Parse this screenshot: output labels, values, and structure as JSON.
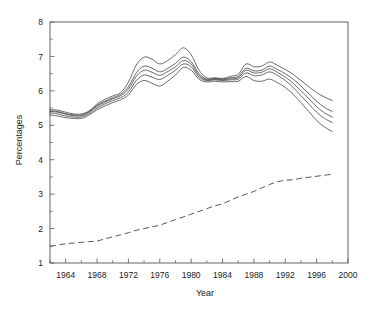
{
  "chart_data": {
    "type": "line",
    "title": "",
    "subtitle": "",
    "xlabel": "Year",
    "ylabel": "Percentages",
    "xlim": [
      1962,
      2000
    ],
    "ylim": [
      1,
      8
    ],
    "xticks": [
      1964,
      1968,
      1972,
      1976,
      1980,
      1984,
      1988,
      1992,
      1996,
      2000
    ],
    "xtick_labels": [
      "1964",
      "1968",
      "1972",
      "1976",
      "1980",
      "1984",
      "1988",
      "1992",
      "1996",
      "2000"
    ],
    "x_minor_step": 2,
    "yticks": [
      1,
      2,
      3,
      4,
      5,
      6,
      7,
      8
    ],
    "ytick_labels": [
      "1",
      "2",
      "3",
      "4",
      "5",
      "6",
      "7",
      "8"
    ],
    "y_minor_step": 0.5,
    "grid": false,
    "legend_position": "none",
    "frame": "box",
    "x": [
      1962,
      1963,
      1964,
      1965,
      1966,
      1967,
      1968,
      1969,
      1970,
      1971,
      1972,
      1973,
      1974,
      1975,
      1976,
      1977,
      1978,
      1979,
      1980,
      1981,
      1982,
      1983,
      1984,
      1985,
      1986,
      1987,
      1988,
      1989,
      1990,
      1991,
      1992,
      1993,
      1994,
      1995,
      1996,
      1997,
      1998
    ],
    "series": [
      {
        "name": "upper-band",
        "style": "solid",
        "values": [
          5.45,
          5.44,
          5.38,
          5.33,
          5.33,
          5.42,
          5.62,
          5.75,
          5.85,
          5.95,
          6.25,
          6.75,
          6.98,
          6.92,
          6.78,
          6.88,
          7.05,
          7.25,
          7.05,
          6.6,
          6.38,
          6.38,
          6.36,
          6.42,
          6.48,
          6.78,
          6.7,
          6.72,
          6.84,
          6.74,
          6.62,
          6.48,
          6.3,
          6.12,
          5.95,
          5.82,
          5.72
        ]
      },
      {
        "name": "upper-mid-band",
        "style": "solid",
        "values": [
          5.42,
          5.4,
          5.34,
          5.3,
          5.3,
          5.4,
          5.58,
          5.7,
          5.8,
          5.9,
          6.12,
          6.52,
          6.72,
          6.66,
          6.55,
          6.65,
          6.8,
          6.98,
          6.85,
          6.5,
          6.34,
          6.36,
          6.34,
          6.38,
          6.42,
          6.66,
          6.58,
          6.6,
          6.72,
          6.62,
          6.5,
          6.34,
          6.14,
          5.92,
          5.7,
          5.52,
          5.4
        ]
      },
      {
        "name": "central-band",
        "style": "solid",
        "values": [
          5.4,
          5.38,
          5.32,
          5.28,
          5.28,
          5.38,
          5.55,
          5.67,
          5.77,
          5.86,
          6.05,
          6.42,
          6.6,
          6.54,
          6.45,
          6.56,
          6.7,
          6.88,
          6.78,
          6.45,
          6.32,
          6.34,
          6.32,
          6.35,
          6.38,
          6.6,
          6.52,
          6.54,
          6.64,
          6.54,
          6.4,
          6.22,
          6.0,
          5.78,
          5.54,
          5.36,
          5.24
        ]
      },
      {
        "name": "lower-mid-band",
        "style": "solid",
        "values": [
          5.36,
          5.33,
          5.27,
          5.24,
          5.24,
          5.34,
          5.5,
          5.62,
          5.72,
          5.8,
          5.96,
          6.3,
          6.46,
          6.4,
          6.33,
          6.45,
          6.6,
          6.78,
          6.7,
          6.4,
          6.3,
          6.32,
          6.3,
          6.32,
          6.34,
          6.52,
          6.44,
          6.46,
          6.55,
          6.45,
          6.3,
          6.1,
          5.86,
          5.62,
          5.38,
          5.2,
          5.08
        ]
      },
      {
        "name": "lower-band",
        "style": "solid",
        "values": [
          5.3,
          5.27,
          5.22,
          5.2,
          5.2,
          5.3,
          5.45,
          5.56,
          5.66,
          5.74,
          5.88,
          6.18,
          6.3,
          6.22,
          6.14,
          6.28,
          6.46,
          6.68,
          6.6,
          6.34,
          6.26,
          6.28,
          6.26,
          6.27,
          6.28,
          6.42,
          6.3,
          6.28,
          6.34,
          6.24,
          6.1,
          5.9,
          5.66,
          5.4,
          5.14,
          4.95,
          4.82
        ]
      },
      {
        "name": "dashed-trend",
        "style": "dashed",
        "values": [
          1.48,
          1.52,
          1.56,
          1.58,
          1.6,
          1.62,
          1.64,
          1.7,
          1.76,
          1.82,
          1.88,
          1.95,
          2.0,
          2.05,
          2.1,
          2.18,
          2.26,
          2.34,
          2.42,
          2.5,
          2.58,
          2.66,
          2.72,
          2.82,
          2.92,
          3.0,
          3.08,
          3.18,
          3.28,
          3.36,
          3.4,
          3.42,
          3.46,
          3.49,
          3.52,
          3.55,
          3.58
        ]
      }
    ]
  }
}
